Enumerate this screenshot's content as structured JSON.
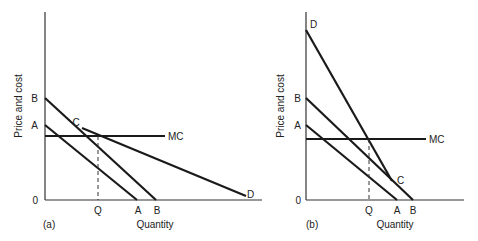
{
  "panels": [
    {
      "id": "a",
      "caption": "(a)",
      "ylabel": "Price and cost",
      "xlabel": "Quantity",
      "origin_label": "0",
      "y_labels": {
        "B": "B",
        "A": "A"
      },
      "x_labels": {
        "Q": "Q",
        "A": "A",
        "B": "B"
      },
      "curve_labels": {
        "MC": "MC",
        "C": "C",
        "D": "D"
      }
    },
    {
      "id": "b",
      "caption": "(b)",
      "ylabel": "Price and cost",
      "xlabel": "Quantity",
      "origin_label": "0",
      "y_labels": {
        "D": "D",
        "B": "B",
        "A": "A"
      },
      "x_labels": {
        "Q": "Q",
        "A": "A",
        "B": "B"
      },
      "curve_labels": {
        "MC": "MC",
        "C": "C"
      }
    }
  ]
}
